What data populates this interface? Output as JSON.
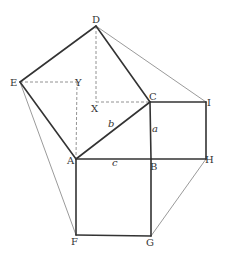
{
  "points": {
    "D": {
      "label": "D"
    },
    "E": {
      "label": "E"
    },
    "Y": {
      "label": "Y"
    },
    "X": {
      "label": "X"
    },
    "C": {
      "label": "C"
    },
    "I": {
      "label": "I"
    },
    "A": {
      "label": "A"
    },
    "B": {
      "label": "B"
    },
    "H": {
      "label": "H"
    },
    "F": {
      "label": "F"
    },
    "G": {
      "label": "G"
    }
  },
  "side_labels": {
    "a": "a",
    "b": "b",
    "c": "c"
  },
  "segments": {
    "thick": [
      [
        "A",
        "C"
      ],
      [
        "C",
        "D"
      ],
      [
        "D",
        "E"
      ],
      [
        "E",
        "A"
      ],
      [
        "C",
        "B"
      ],
      [
        "C",
        "I"
      ],
      [
        "I",
        "H"
      ],
      [
        "B",
        "H"
      ],
      [
        "A",
        "B"
      ],
      [
        "A",
        "F"
      ],
      [
        "F",
        "G"
      ],
      [
        "G",
        "B"
      ]
    ],
    "thin": [
      [
        "D",
        "I"
      ],
      [
        "E",
        "F"
      ],
      [
        "H",
        "G"
      ]
    ],
    "dashed": [
      [
        "E",
        "Y"
      ],
      [
        "Y",
        "A"
      ],
      [
        "D",
        "X"
      ],
      [
        "X",
        "C"
      ]
    ]
  },
  "colors": {
    "stroke": "#333333",
    "text": "#333333",
    "background": "#ffffff"
  }
}
